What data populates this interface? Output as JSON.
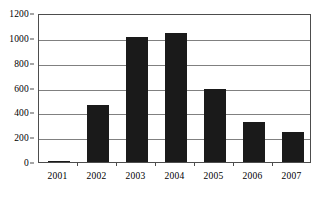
{
  "chart_data": {
    "type": "bar",
    "title": "",
    "subtitle": "",
    "xlabel": "",
    "ylabel": "",
    "categories": [
      "2001",
      "2002",
      "2003",
      "2004",
      "2005",
      "2006",
      "2007"
    ],
    "values": [
      12,
      460,
      1010,
      1040,
      585,
      320,
      245
    ],
    "ylim": [
      0,
      1200
    ],
    "ytick_labels": [
      "0",
      "200",
      "400",
      "600",
      "800",
      "1000",
      "1200"
    ],
    "ytick_values": [
      0,
      200,
      400,
      600,
      800,
      1000,
      1200
    ],
    "grid": "horizontal",
    "legend": "none",
    "series": [
      {
        "name": "",
        "values": [
          12,
          460,
          1010,
          1040,
          585,
          320,
          245
        ]
      }
    ],
    "colors": {
      "bar": "#1a1a1a",
      "gridline": "#808080",
      "axis": "#4d4d4d",
      "background": "#ffffff",
      "text": "#000000"
    }
  }
}
